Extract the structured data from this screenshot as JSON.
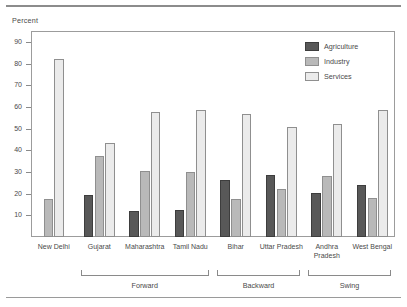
{
  "chart_data": {
    "type": "bar",
    "title": "",
    "subtitle": "",
    "ylabel": "Percent",
    "xlabel": "",
    "ylim": [
      0,
      95
    ],
    "yticks": [
      10,
      20,
      30,
      40,
      50,
      60,
      70,
      80,
      90
    ],
    "grid": false,
    "legend_position": "top-right",
    "categories": [
      "New Delhi",
      "Gujarat",
      "Maharashtra",
      "Tamil Nadu",
      "Bihar",
      "Uttar Pradesh",
      "Andhra\nPradesh",
      "West Bengal"
    ],
    "series": [
      {
        "name": "Agriculture",
        "color": "#585858",
        "values": [
          null,
          19.5,
          12.2,
          12.4,
          26.2,
          28.5,
          20.5,
          24.2
        ]
      },
      {
        "name": "Industry",
        "color": "#b9b9b9",
        "values": [
          17.6,
          37.3,
          30.6,
          30.1,
          17.7,
          22.1,
          28.2,
          18.1
        ]
      },
      {
        "name": "Services",
        "color": "#ebebeb",
        "values": [
          82.2,
          43.4,
          57.5,
          58.5,
          56.5,
          50.6,
          52.2,
          58.7
        ]
      }
    ],
    "groups": [
      {
        "label": "Forward",
        "members": [
          "Gujarat",
          "Maharashtra",
          "Tamil Nadu"
        ]
      },
      {
        "label": "Backward",
        "members": [
          "Bihar",
          "Uttar Pradesh"
        ]
      },
      {
        "label": "Swing",
        "members": [
          "Andhra Pradesh",
          "West Bengal"
        ]
      }
    ]
  },
  "legend": {
    "items": [
      {
        "label": "Agriculture",
        "key": "agriculture"
      },
      {
        "label": "Industry",
        "key": "industry"
      },
      {
        "label": "Services",
        "key": "services"
      }
    ]
  }
}
